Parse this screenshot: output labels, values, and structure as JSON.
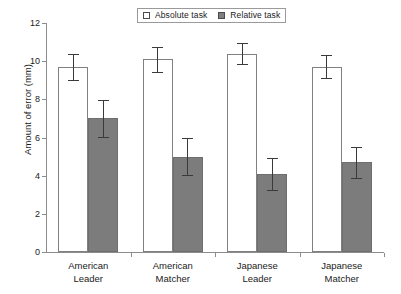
{
  "chart_data": {
    "type": "bar",
    "title": "",
    "xlabel": "",
    "ylabel": "Amount of error (mm)",
    "ylim": [
      0,
      12
    ],
    "ytick_values": [
      0,
      2,
      4,
      6,
      8,
      10,
      12
    ],
    "ytick_labels": [
      "0",
      "2",
      "4",
      "6",
      "8",
      "10",
      "12"
    ],
    "grid": false,
    "legend_position": "top-center",
    "categories": [
      "American Leader",
      "American Matcher",
      "Japanese Leader",
      "Japanese Matcher"
    ],
    "category_lines": [
      [
        "American",
        "Leader"
      ],
      [
        "American",
        "Matcher"
      ],
      [
        "Japanese",
        "Leader"
      ],
      [
        "Japanese",
        "Matcher"
      ]
    ],
    "series": [
      {
        "name": "Absolute task",
        "color": "#ffffff",
        "edge_color": "#808080",
        "values": [
          9.7,
          10.1,
          10.4,
          9.7
        ],
        "errors": [
          0.7,
          0.65,
          0.55,
          0.6
        ]
      },
      {
        "name": "Relative task",
        "color": "#7c7c7c",
        "edge_color": "#6e6e6e",
        "values": [
          7.0,
          5.0,
          4.1,
          4.7
        ],
        "errors": [
          0.95,
          0.95,
          0.85,
          0.8
        ]
      }
    ],
    "error_bar_type": "standard error"
  },
  "legend": {
    "entries": [
      {
        "label": "Absolute task",
        "swatch": "open-square-swatch"
      },
      {
        "label": "Relative task",
        "swatch": "filled-square-swatch"
      }
    ]
  },
  "colors": {
    "axis": "#8c8c8c",
    "error_bar": "#3a3a3a",
    "absolute_fill": "#ffffff",
    "relative_fill": "#7c7c7c",
    "text": "#1b1b1b",
    "background": "#ffffff"
  }
}
